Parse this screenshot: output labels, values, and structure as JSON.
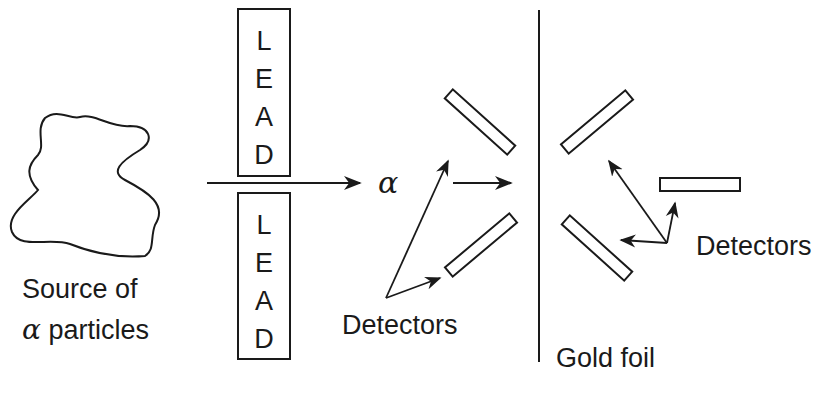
{
  "diagram": {
    "source": {
      "line1": "Source of",
      "alpha_symbol": "α",
      "line2": "particles"
    },
    "lead_top": {
      "letters": [
        "L",
        "E",
        "A",
        "D"
      ]
    },
    "lead_bottom": {
      "letters": [
        "L",
        "E",
        "A",
        "D"
      ]
    },
    "beam_label": "α",
    "detectors_left_label": "Detectors",
    "detectors_right_label": "Detectors",
    "foil_label": "Gold foil"
  },
  "colors": {
    "stroke": "#1a1a1a",
    "background": "#ffffff"
  }
}
